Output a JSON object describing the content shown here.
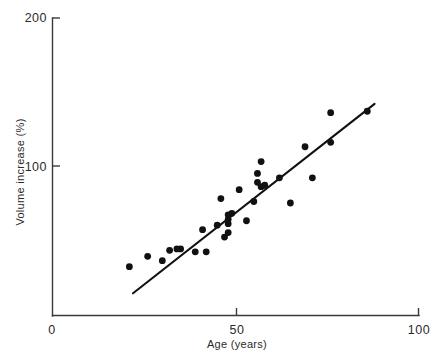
{
  "chart_data": {
    "type": "scatter",
    "title": "",
    "xlabel": "Age (years)",
    "ylabel": "Volume increase (%)",
    "xlim": [
      0,
      100
    ],
    "ylim": [
      0,
      200
    ],
    "xticks": [
      0,
      50,
      100
    ],
    "xticklabels": [
      "0",
      "50",
      "100"
    ],
    "yticks": [
      100,
      200
    ],
    "yticklabels": [
      "100",
      "200"
    ],
    "grid": false,
    "legend": null,
    "series": [
      {
        "name": "Volume increase vs age",
        "marker": "filled-circle",
        "color": "#111111",
        "points": [
          {
            "x": 21,
            "y": 168
          },
          {
            "x": 26,
            "y": 161
          },
          {
            "x": 30,
            "y": 164
          },
          {
            "x": 32,
            "y": 157
          },
          {
            "x": 34,
            "y": 156
          },
          {
            "x": 35,
            "y": 156
          },
          {
            "x": 39,
            "y": 158
          },
          {
            "x": 42,
            "y": 158
          },
          {
            "x": 41,
            "y": 143
          },
          {
            "x": 45,
            "y": 140
          },
          {
            "x": 47,
            "y": 148
          },
          {
            "x": 48,
            "y": 145
          },
          {
            "x": 48,
            "y": 139
          },
          {
            "x": 48,
            "y": 136
          },
          {
            "x": 48,
            "y": 133
          },
          {
            "x": 49,
            "y": 132
          },
          {
            "x": 46,
            "y": 122
          },
          {
            "x": 53,
            "y": 137
          },
          {
            "x": 55,
            "y": 124
          },
          {
            "x": 51,
            "y": 116
          },
          {
            "x": 56,
            "y": 111
          },
          {
            "x": 56,
            "y": 105
          },
          {
            "x": 57,
            "y": 114
          },
          {
            "x": 58,
            "y": 113
          },
          {
            "x": 57,
            "y": 97
          },
          {
            "x": 65,
            "y": 125
          },
          {
            "x": 62,
            "y": 108
          },
          {
            "x": 71,
            "y": 108
          },
          {
            "x": 69,
            "y": 87
          },
          {
            "x": 76,
            "y": 84
          },
          {
            "x": 76,
            "y": 64
          },
          {
            "x": 86,
            "y": 63
          }
        ]
      }
    ],
    "trend_line": {
      "name": "regression-line",
      "style": "solid",
      "color": "#111111",
      "x_start": 22,
      "y_start": 186,
      "x_end": 88,
      "y_end": 58
    }
  }
}
